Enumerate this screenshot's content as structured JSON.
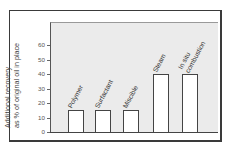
{
  "chart_data": {
    "type": "bar",
    "title": "",
    "xlabel": "",
    "ylabel": "Additional recovery as % of original oil in place",
    "ylabel_lines": [
      "Additional recovery",
      "as % of original oil in place"
    ],
    "categories": [
      "Polymer",
      "Surfactant",
      "Miscible",
      "Steam",
      "In situ combustion"
    ],
    "category_lines": [
      [
        "Polymer"
      ],
      [
        "Surfactant"
      ],
      [
        "Miscible"
      ],
      [
        "Steam"
      ],
      [
        "In situ",
        "combustion"
      ]
    ],
    "values": [
      15,
      15,
      15,
      40,
      40
    ],
    "ylim": [
      0,
      70
    ],
    "yticks": [
      0,
      10,
      20,
      30,
      40,
      50,
      60
    ],
    "ytick_labels": [
      "0",
      "10",
      "20",
      "30",
      "40",
      "50",
      "60"
    ],
    "grid": false,
    "legend": null
  },
  "colors": {
    "plot_background": "#ebebeb",
    "bar_fill": "#ffffff",
    "bar_edge": "#444444",
    "frame": "#3a3a3a"
  }
}
